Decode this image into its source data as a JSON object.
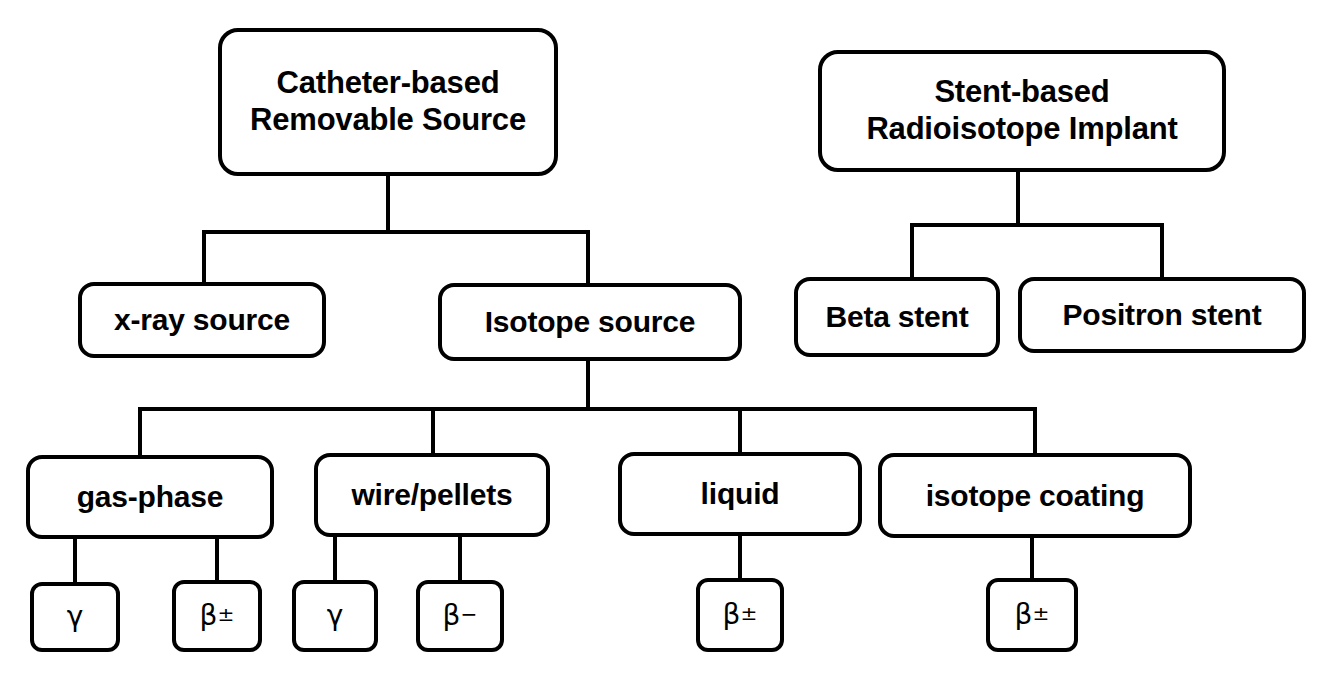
{
  "diagram": {
    "background_color": "#ffffff",
    "line_color": "#000000",
    "box_fill": "#ffffff"
  },
  "nodes": {
    "catheter_root": {
      "label": "Catheter-based\nRemovable Source",
      "x": 218,
      "y": 28,
      "w": 340,
      "h": 148
    },
    "stent_root": {
      "label": "Stent-based\nRadioisotope Implant",
      "x": 818,
      "y": 50,
      "w": 408,
      "h": 122
    },
    "xray_source": {
      "label": "x-ray source",
      "x": 78,
      "y": 282,
      "w": 248,
      "h": 76
    },
    "isotope_source": {
      "label": "Isotope source",
      "x": 438,
      "y": 283,
      "w": 304,
      "h": 78
    },
    "beta_stent": {
      "label": "Beta stent",
      "x": 794,
      "y": 277,
      "w": 206,
      "h": 80
    },
    "positron_stent": {
      "label": "Positron stent",
      "x": 1018,
      "y": 277,
      "w": 288,
      "h": 76
    },
    "gas_phase": {
      "label": "gas-phase",
      "x": 26,
      "y": 455,
      "w": 248,
      "h": 84
    },
    "wire_pellets": {
      "label": "wire/pellets",
      "x": 314,
      "y": 453,
      "w": 236,
      "h": 84
    },
    "liquid": {
      "label": "liquid",
      "x": 618,
      "y": 452,
      "w": 244,
      "h": 84
    },
    "isotope_coating": {
      "label": "isotope coating",
      "x": 878,
      "y": 453,
      "w": 314,
      "h": 85
    },
    "leaf_gamma_gas": {
      "label": "γ",
      "x": 30,
      "y": 582,
      "w": 90,
      "h": 70
    },
    "leaf_beta_pm_gas": {
      "label": "β±",
      "x": 172,
      "y": 580,
      "w": 90,
      "h": 72
    },
    "leaf_gamma_wire": {
      "label": "γ",
      "x": 292,
      "y": 580,
      "w": 86,
      "h": 72
    },
    "leaf_beta_minus_wire": {
      "label": "β−",
      "x": 416,
      "y": 580,
      "w": 88,
      "h": 72
    },
    "leaf_beta_pm_liquid": {
      "label": "β±",
      "x": 696,
      "y": 578,
      "w": 88,
      "h": 74
    },
    "leaf_beta_pm_coating": {
      "label": "β±",
      "x": 986,
      "y": 578,
      "w": 92,
      "h": 74
    }
  },
  "leaf_symbols": {
    "gamma": "γ",
    "beta_plusminus_base": "β",
    "beta_plusminus_sup": "±",
    "beta_minus_base": "β",
    "beta_minus_sup": "−"
  },
  "connectors": {
    "stroke_width": 4,
    "paths": [
      "M 388 176 L 388 232",
      "M 204 232 L 588 232",
      "M 204 232 L 204 282",
      "M 588 232 L 588 283",
      "M 1018 172 L 1018 225",
      "M 912 225 L 1162 225",
      "M 912 225 L 912 277",
      "M 1162 225 L 1162 277",
      "M 588 361 L 588 409",
      "M 140 409 L 1035 409",
      "M 140 409 L 140 455",
      "M 433 409 L 433 453",
      "M 740 409 L 740 452",
      "M 1035 409 L 1035 453",
      "M 75 539 L 75 582",
      "M 217 539 L 217 580",
      "M 335 537 L 335 580",
      "M 460 537 L 460 580",
      "M 740 536 L 740 578",
      "M 1032 538 L 1032 578"
    ]
  }
}
